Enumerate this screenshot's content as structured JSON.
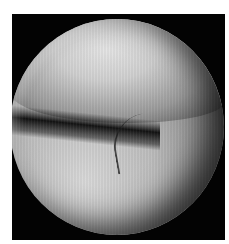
{
  "image": {
    "description": "Grayscale arthroscopic view inside a circular endoscope field on a black square frame",
    "colors": {
      "background": "#ffffff",
      "frame": "#030303",
      "highlight": "#e4e4e4",
      "midtone": "#9a9a9a",
      "shadow": "#0a0a0a"
    }
  }
}
